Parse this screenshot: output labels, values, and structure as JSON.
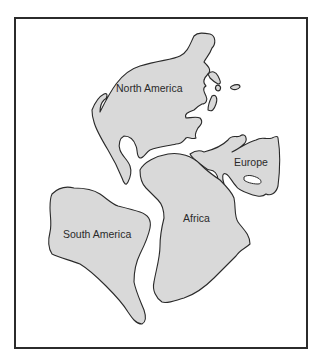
{
  "figure": {
    "type": "continental-drift-map",
    "continents": [
      {
        "name": "North America",
        "label": "North America"
      },
      {
        "name": "Europe",
        "label": "Europe"
      },
      {
        "name": "Africa",
        "label": "Africa"
      },
      {
        "name": "South America",
        "label": "South America"
      }
    ],
    "colors": {
      "land": "#d9d9d9",
      "outline": "#2a2a2a",
      "background": "#ffffff",
      "frame": "#2b2b2b"
    }
  }
}
